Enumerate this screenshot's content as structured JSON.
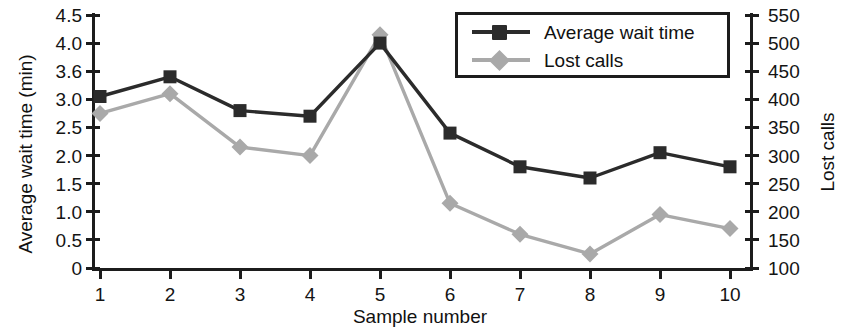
{
  "chart_data": {
    "type": "line",
    "title": "",
    "xlabel": "Sample number",
    "ylabel": "Average wait time (min)",
    "y2label": "Lost calls",
    "categories": [
      "1",
      "2",
      "3",
      "4",
      "5",
      "6",
      "7",
      "8",
      "9",
      "10"
    ],
    "x": [
      1,
      2,
      3,
      4,
      5,
      6,
      7,
      8,
      9,
      10
    ],
    "grid": false,
    "legend_position": "top-right",
    "ylim": [
      0,
      4.5
    ],
    "y2lim": [
      100,
      550
    ],
    "yticks": [
      "0",
      "0.5",
      "1.0",
      "1.5",
      "2.0",
      "2.5",
      "3.0",
      "3.6",
      "4.0",
      "4.5"
    ],
    "ytick_values": [
      0,
      0.5,
      1.0,
      1.5,
      2.0,
      2.5,
      3.0,
      3.5,
      4.0,
      4.5
    ],
    "y2ticks": [
      "100",
      "150",
      "200",
      "250",
      "300",
      "350",
      "400",
      "450",
      "500",
      "550"
    ],
    "y2tick_values": [
      100,
      150,
      200,
      250,
      300,
      350,
      400,
      450,
      500,
      550
    ],
    "series": [
      {
        "name": "Average wait time",
        "axis": "left",
        "color": "#2b2b2b",
        "marker": "square",
        "values": [
          3.05,
          3.4,
          2.8,
          2.7,
          4.0,
          2.4,
          1.8,
          1.6,
          2.05,
          1.8
        ]
      },
      {
        "name": "Lost calls",
        "axis": "right",
        "color": "#a9a9a9",
        "marker": "diamond",
        "values": [
          375,
          410,
          315,
          300,
          515,
          215,
          160,
          125,
          195,
          170
        ]
      }
    ]
  },
  "legend": {
    "items": [
      {
        "label": "Average wait time"
      },
      {
        "label": "Lost calls"
      }
    ]
  },
  "colors": {
    "axis": "#1c1c1c",
    "text": "#141414",
    "series_dark": "#2b2b2b",
    "series_gray": "#a9a9a9",
    "background": "#ffffff"
  }
}
